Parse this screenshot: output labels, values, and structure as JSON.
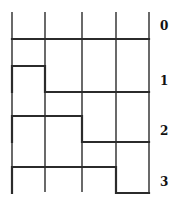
{
  "diagram": {
    "type": "timing-diagram",
    "columns": 4,
    "grid": {
      "x_positions": [
        12,
        45,
        82,
        116,
        149
      ],
      "y_top": 12,
      "y_bottom": 192,
      "color": "#1a1a1a"
    },
    "wave_color": "#2b2b2b",
    "rows": [
      {
        "label": "0",
        "high_until_column": 0,
        "y_high": 39,
        "y_low": 39,
        "label_y": 20
      },
      {
        "label": "1",
        "high_until_column": 1,
        "y_high": 66,
        "y_low": 92,
        "label_y": 75
      },
      {
        "label": "2",
        "high_until_column": 2,
        "y_high": 116,
        "y_low": 142,
        "label_y": 125
      },
      {
        "label": "3",
        "high_until_column": 3,
        "y_high": 167,
        "y_low": 193,
        "label_y": 176
      }
    ]
  }
}
